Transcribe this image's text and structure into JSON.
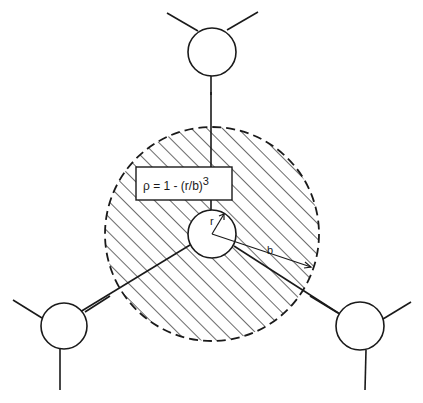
{
  "diagram": {
    "formula": {
      "rho": "ρ = 1 - (r/b)",
      "exponent": "3"
    },
    "labels": {
      "inner_radius": "r",
      "outer_radius": "b"
    },
    "colors": {
      "stroke": "#1a1a1a",
      "background": "#ffffff"
    }
  }
}
